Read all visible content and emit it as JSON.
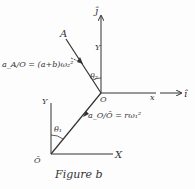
{
  "figure": {
    "caption": "Figure b",
    "colors": {
      "ink": "#333333",
      "background": "#fdfdfd"
    }
  },
  "upper_frame": {
    "origin_label": "O",
    "vertical_axis_label": "Y",
    "vertical_unit_label": "ĵ",
    "horizontal_axis_label": "x",
    "horizontal_unit_label": "î",
    "angle_label": "θ₂"
  },
  "lower_frame": {
    "origin_label": "Ō",
    "vertical_axis_label": "Y",
    "horizontal_axis_label": "X",
    "angle_label": "θ₁"
  },
  "points": {
    "A": "A"
  },
  "annotations": {
    "accel_A_rel_O": "a_A/O = (a+b)ω₂²",
    "accel_O_rel_Obar": "a_O/Ō = rω₁²"
  }
}
